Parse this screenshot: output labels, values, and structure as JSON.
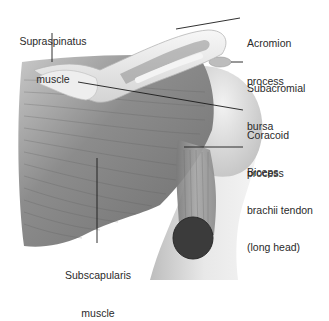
{
  "figure": {
    "type": "anatomical-illustration",
    "colors": {
      "background": "#ffffff",
      "muscle": "#8a8a8a",
      "bone": "#e6e6e6",
      "tendon_cut": "#3a3a3a",
      "text": "#2a2a2a",
      "leader": "#1a1a1a"
    }
  },
  "labels": [
    {
      "id": "supraspinatus",
      "line1": "Supraspinatus",
      "line2": "muscle"
    },
    {
      "id": "acromion",
      "line1": "Acromion",
      "line2": "process"
    },
    {
      "id": "subacromial",
      "line1": "Subacromial",
      "line2": "bursa"
    },
    {
      "id": "coracoid",
      "line1": "Coracoid",
      "line2": "process"
    },
    {
      "id": "biceps",
      "line1": "Biceps",
      "line2": "brachii tendon",
      "line3": "(long head)"
    },
    {
      "id": "subscapularis",
      "line1": "Subscapularis",
      "line2": "muscle"
    }
  ]
}
